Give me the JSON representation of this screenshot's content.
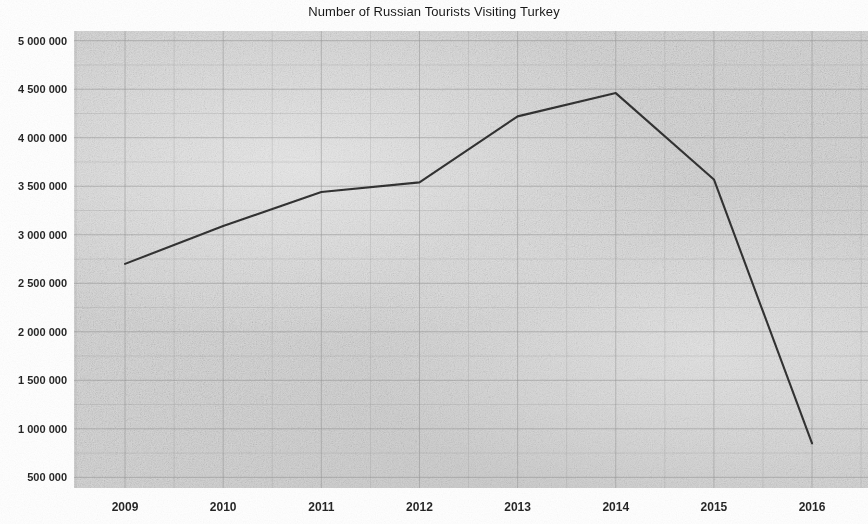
{
  "chart_data": {
    "type": "line",
    "title": "Number of Russian Tourists Visiting Turkey",
    "xlabel": "",
    "ylabel": "",
    "grid": true,
    "legend": "none",
    "line_color": "#2b2b2b",
    "plot_background": "#d9d9d9",
    "x": [
      2009,
      2010,
      2011,
      2012,
      2013,
      2014,
      2015,
      2016
    ],
    "x_tick_labels": [
      "2009",
      "2010",
      "2011",
      "2012",
      "2013",
      "2014",
      "2015",
      "2016"
    ],
    "values": [
      2700000,
      3090000,
      3440000,
      3540000,
      4220000,
      4460000,
      3570000,
      850000
    ],
    "series": [
      {
        "name": "Russian tourists",
        "values": [
          2700000,
          3090000,
          3440000,
          3540000,
          4220000,
          4460000,
          3570000,
          850000
        ]
      }
    ],
    "xlim": [
      2008.48,
      2016.57
    ],
    "ylim": [
      390000,
      5100000
    ],
    "y_ticks": [
      5000000,
      4500000,
      4000000,
      3500000,
      3000000,
      2500000,
      2000000,
      1500000,
      1000000,
      500000
    ],
    "y_tick_labels": [
      "5 000 000",
      "4 500 000",
      "4 000 000",
      "3 500 000",
      "3 000 000",
      "2 500 000",
      "2 000 000",
      "1 500 000",
      "1 000 000",
      "500 000"
    ],
    "y_minor_step": 250000,
    "x_minor_step": 0.5
  }
}
